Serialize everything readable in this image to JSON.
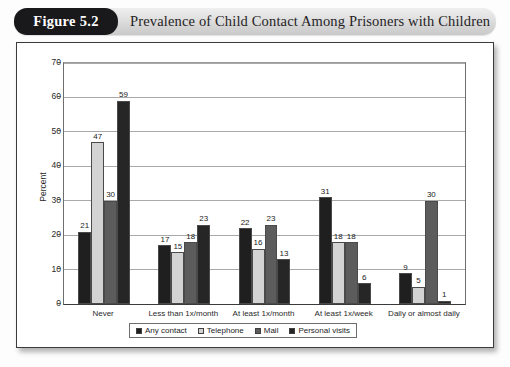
{
  "figure": {
    "badge": "Figure 5.2",
    "title": "Prevalence of Child Contact Among Prisoners with Children"
  },
  "chart_data": {
    "type": "bar",
    "title": "Prevalence of Child Contact Among Prisoners with Children",
    "xlabel": "",
    "ylabel": "Percent",
    "ylim": [
      0,
      70
    ],
    "ytick_labels": [
      "0",
      "10",
      "20",
      "30",
      "40",
      "50",
      "60",
      "70"
    ],
    "yticks": [
      0,
      10,
      20,
      30,
      40,
      50,
      60,
      70
    ],
    "grid": true,
    "legend_position": "bottom",
    "categories": [
      "Never",
      "Less than 1x/month",
      "At least 1x/month",
      "At least 1x/week",
      "Daily or almost daily"
    ],
    "series": [
      {
        "name": "Any contact",
        "color": "#201f20",
        "values": [
          21,
          17,
          22,
          31,
          9
        ]
      },
      {
        "name": "Telephone",
        "color": "#d3d3d3",
        "values": [
          47,
          15,
          16,
          18,
          5
        ]
      },
      {
        "name": "Mail",
        "color": "#5c5c5c",
        "values": [
          30,
          18,
          23,
          18,
          30
        ]
      },
      {
        "name": "Personal visits",
        "color": "#272626",
        "values": [
          59,
          23,
          13,
          6,
          1
        ]
      }
    ]
  }
}
